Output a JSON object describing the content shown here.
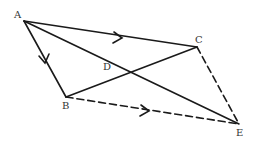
{
  "diagram": {
    "points": {
      "A": {
        "label": "A",
        "x": 24,
        "y": 21
      },
      "B": {
        "label": "B",
        "x": 66,
        "y": 97
      },
      "C": {
        "label": "C",
        "x": 197,
        "y": 47
      },
      "D": {
        "label": "D",
        "x": 107,
        "y": 66
      },
      "E": {
        "label": "E",
        "x": 239,
        "y": 124
      }
    },
    "segments": [
      {
        "from": "A",
        "to": "C",
        "style": "solid",
        "arrow": true
      },
      {
        "from": "A",
        "to": "B",
        "style": "solid",
        "arrow": true
      },
      {
        "from": "A",
        "to": "E",
        "style": "solid",
        "arrow": false
      },
      {
        "from": "B",
        "to": "C",
        "style": "solid",
        "arrow": false
      },
      {
        "from": "B",
        "to": "E",
        "style": "dashed",
        "arrow": true
      },
      {
        "from": "C",
        "to": "E",
        "style": "dashed",
        "arrow": false
      }
    ],
    "colors": {
      "line": "#1a1a1a",
      "label": "#333333"
    }
  }
}
